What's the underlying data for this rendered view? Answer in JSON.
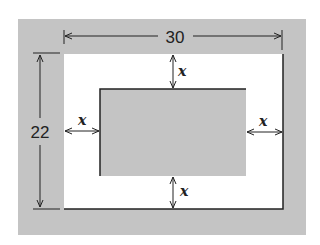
{
  "diagram": {
    "width_label": "30",
    "height_label": "22",
    "margin_labels": {
      "top": "x",
      "left": "x",
      "right": "x",
      "bottom": "x"
    },
    "colors": {
      "frame": "#c4c4c4",
      "inner": "#c4c4c4",
      "background": "#ffffff",
      "line": "#222222"
    }
  }
}
